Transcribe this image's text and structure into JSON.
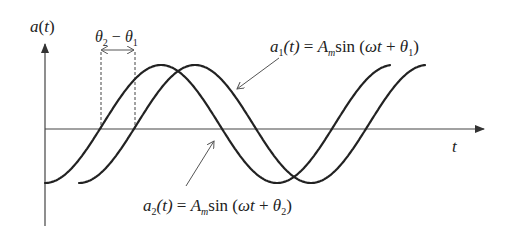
{
  "diagram": {
    "type": "phase-difference-sinusoids",
    "y_axis_label": {
      "fn": "a",
      "arg": "t"
    },
    "x_axis_label": "t",
    "phase_label": {
      "a": "θ",
      "a_sub": "2",
      "op": " − ",
      "b": "θ",
      "b_sub": "1"
    },
    "curve1_label": {
      "fn": "a",
      "sub": "1",
      "arg": "(t)",
      "eq": " = ",
      "amp": "A",
      "amp_sub": "m",
      "func": "sin",
      "open": " (",
      "omega": "ωt",
      "plus": " + ",
      "theta": "θ",
      "theta_sub": "1",
      "close": ")"
    },
    "curve2_label": {
      "fn": "a",
      "sub": "2",
      "arg": "(t)",
      "eq": " = ",
      "amp": "A",
      "amp_sub": "m",
      "func": "sin",
      "open": " (",
      "omega": "ωt",
      "plus": " + ",
      "theta": "θ",
      "theta_sub": "2",
      "close": ")"
    },
    "colors": {
      "curve": "#222222",
      "axis": "#444444",
      "background": "#ffffff"
    }
  }
}
